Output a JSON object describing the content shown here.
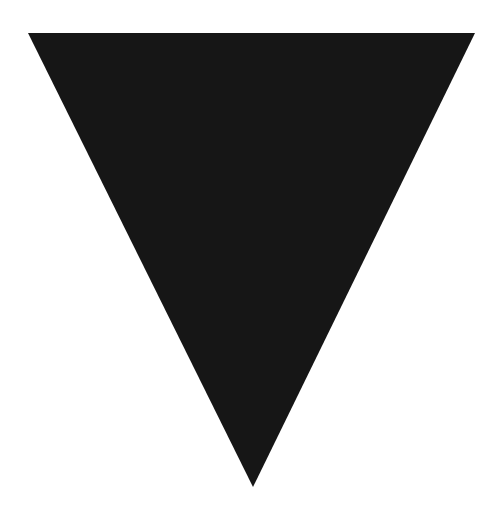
{
  "shape": {
    "type": "inverted-triangle",
    "points": "28,33 475,33 253,487",
    "fill": "#161616"
  },
  "background": "#ffffff"
}
